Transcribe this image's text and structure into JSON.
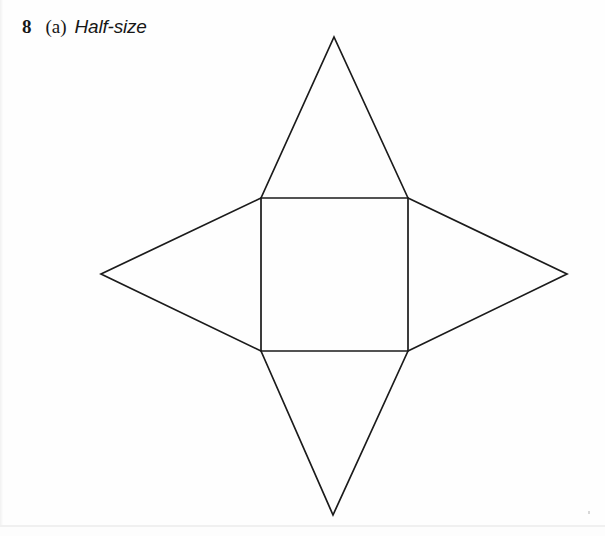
{
  "page": {
    "background_color": "#fefefe",
    "width": 605,
    "height": 536
  },
  "caption": {
    "question_number": "8",
    "part_label": "(a)",
    "text": "Half-size"
  },
  "figure": {
    "name": "square-pyramid-net",
    "stroke_color": "#1b1b1b",
    "stroke_width": 1.7,
    "fill": "none",
    "square": {
      "left": 261,
      "top": 198,
      "right": 408,
      "bottom": 351,
      "width": 147,
      "height": 153
    },
    "apexes": {
      "top": {
        "x": 334,
        "y": 37
      },
      "bottom": {
        "x": 333,
        "y": 515
      },
      "left": {
        "x": 101,
        "y": 274
      },
      "right": {
        "x": 567,
        "y": 274
      }
    },
    "paths": {
      "square": "M 261 198 L 408 198 L 408 351 L 261 351 Z",
      "top_triangle": "M 261 198 L 334 37 L 408 198",
      "bottom_triangle": "M 261 351 L 333 515 L 408 351",
      "left_triangle": "M 261 198 L 101 274 L 261 351",
      "right_triangle": "M 408 198 L 567 274 L 408 351"
    }
  }
}
